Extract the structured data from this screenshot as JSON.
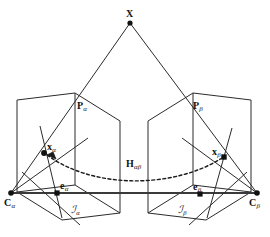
{
  "figure": {
    "background_color": "#ffffff",
    "stroke_color": "#2b2b2b",
    "baseline_color": "#3a3a3a",
    "point_color": "#111111",
    "width": 270,
    "height": 237
  },
  "labels": {
    "scene_point": {
      "symbol": "X",
      "subscript": ""
    },
    "ray_alpha": {
      "symbol": "P",
      "subscript": "α"
    },
    "ray_beta": {
      "symbol": "P",
      "subscript": "β"
    },
    "image_point_alpha": {
      "symbol": "x",
      "subscript": "α"
    },
    "image_point_beta": {
      "symbol": "x",
      "subscript": "β"
    },
    "epipole_alpha": {
      "symbol": "e",
      "subscript": "α"
    },
    "epipole_beta": {
      "symbol": "e",
      "subscript": "β"
    },
    "camera_center_alpha": {
      "symbol": "C",
      "subscript": "α"
    },
    "camera_center_beta": {
      "symbol": "C",
      "subscript": "β"
    },
    "image_plane_alpha": {
      "symbol": "ℐ",
      "subscript": "α"
    },
    "image_plane_beta": {
      "symbol": "ℐ",
      "subscript": "β"
    },
    "homography": {
      "symbol": "H",
      "subscript": "αβ"
    }
  },
  "label_positions": {
    "scene_point": {
      "x": 126,
      "y": 9
    },
    "ray_alpha": {
      "x": 77,
      "y": 101
    },
    "ray_beta": {
      "x": 193,
      "y": 101
    },
    "image_point_alpha": {
      "x": 47,
      "y": 142
    },
    "image_point_beta": {
      "x": 212,
      "y": 147
    },
    "homography": {
      "x": 126,
      "y": 159
    },
    "epipole_alpha": {
      "x": 60,
      "y": 181
    },
    "epipole_beta": {
      "x": 193,
      "y": 182
    },
    "camera_center_alpha": {
      "x": 4,
      "y": 198
    },
    "camera_center_beta": {
      "x": 249,
      "y": 198
    },
    "image_plane_alpha": {
      "x": 71,
      "y": 205
    },
    "image_plane_beta": {
      "x": 178,
      "y": 205
    }
  },
  "geometry": {
    "points": {
      "scene_point": {
        "x": 130,
        "y": 23
      },
      "image_point_alpha": {
        "x": 44,
        "y": 153
      },
      "image_point_beta": {
        "x": 224,
        "y": 157
      },
      "epipole_alpha": {
        "x": 57,
        "y": 193
      },
      "epipole_beta": {
        "x": 200,
        "y": 194
      },
      "camera_center_alpha": {
        "x": 11,
        "y": 193
      },
      "camera_center_beta": {
        "x": 257,
        "y": 193
      }
    },
    "plane_alpha": [
      {
        "x": 17,
        "y": 100
      },
      {
        "x": 75,
        "y": 93
      },
      {
        "x": 75,
        "y": 185
      },
      {
        "x": 17,
        "y": 192
      }
    ],
    "plane_alpha_inner": [
      {
        "x": 17,
        "y": 192
      },
      {
        "x": 75,
        "y": 93
      },
      {
        "x": 75,
        "y": 185
      },
      {
        "x": 62,
        "y": 220
      }
    ],
    "plane_beta": [
      {
        "x": 193,
        "y": 93
      },
      {
        "x": 251,
        "y": 100
      },
      {
        "x": 251,
        "y": 192
      },
      {
        "x": 193,
        "y": 185
      }
    ],
    "ray_alpha": [
      {
        "x": 130,
        "y": 23
      },
      {
        "x": 11,
        "y": 193
      }
    ],
    "ray_beta": [
      {
        "x": 130,
        "y": 23
      },
      {
        "x": 257,
        "y": 193
      }
    ],
    "baseline": [
      {
        "x": 11,
        "y": 193
      },
      {
        "x": 257,
        "y": 193
      }
    ],
    "homography_curve": {
      "start": {
        "x": 47,
        "y": 155
      },
      "c1": {
        "x": 95,
        "y": 190
      },
      "c2": {
        "x": 175,
        "y": 188
      },
      "end": {
        "x": 222,
        "y": 158
      }
    }
  },
  "style": {
    "dot_radius": 2.6,
    "line_width": 1.0,
    "baseline_width": 2.0,
    "dash_pattern": "3,2.5"
  }
}
